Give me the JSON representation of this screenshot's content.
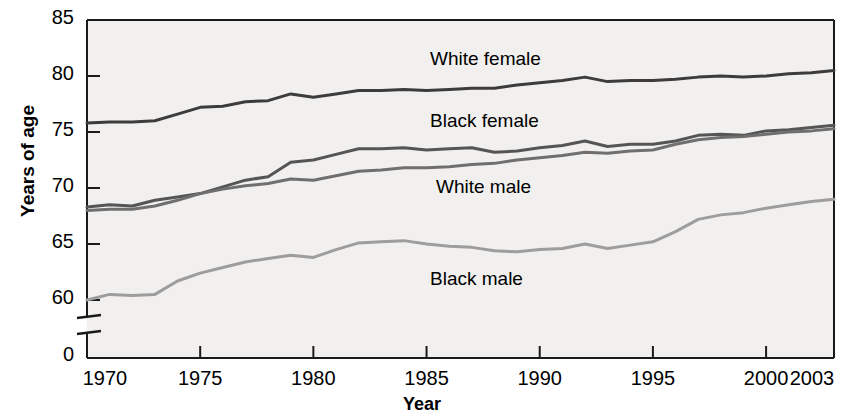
{
  "chart_data": {
    "type": "line",
    "title": "",
    "xlabel": "Year",
    "ylabel": "Years of age",
    "xlim": [
      1970,
      2003
    ],
    "ylim": [
      58.5,
      85
    ],
    "y_axis_break": true,
    "y_zero_tick": "0",
    "grid": false,
    "legend_position": "inline-labels",
    "yticks": [
      60,
      65,
      70,
      75,
      80,
      85
    ],
    "ytick_labels": [
      "60",
      "65",
      "70",
      "75",
      "80",
      "85"
    ],
    "xticks": [
      1970,
      1975,
      1980,
      1985,
      1990,
      1995,
      2000,
      2003
    ],
    "xtick_labels": [
      "1970",
      "1975",
      "1980",
      "1985",
      "1990",
      "1995",
      "2000",
      "2003"
    ],
    "x": [
      1970,
      1971,
      1972,
      1973,
      1974,
      1975,
      1976,
      1977,
      1978,
      1979,
      1980,
      1981,
      1982,
      1983,
      1984,
      1985,
      1986,
      1987,
      1988,
      1989,
      1990,
      1991,
      1992,
      1993,
      1994,
      1995,
      1996,
      1997,
      1998,
      1999,
      2000,
      2001,
      2002,
      2003
    ],
    "series": [
      {
        "name": "White female",
        "color": "#3c3c3c",
        "label_x": 430,
        "label_y": 48,
        "values": [
          75.8,
          75.9,
          75.9,
          76.0,
          76.6,
          77.2,
          77.3,
          77.7,
          77.8,
          78.4,
          78.1,
          78.4,
          78.7,
          78.7,
          78.8,
          78.7,
          78.8,
          78.9,
          78.9,
          79.2,
          79.4,
          79.6,
          79.9,
          79.5,
          79.6,
          79.6,
          79.7,
          79.9,
          80.0,
          79.9,
          80.0,
          80.2,
          80.3,
          80.5
        ]
      },
      {
        "name": "Black female",
        "color": "#555555",
        "label_x": 430,
        "label_y": 110,
        "values": [
          68.3,
          68.5,
          68.4,
          68.9,
          69.2,
          69.5,
          70.1,
          70.7,
          71.0,
          72.3,
          72.5,
          73.0,
          73.5,
          73.5,
          73.6,
          73.4,
          73.5,
          73.6,
          73.2,
          73.3,
          73.6,
          73.8,
          74.2,
          73.7,
          73.9,
          73.9,
          74.2,
          74.7,
          74.8,
          74.7,
          75.1,
          75.2,
          75.4,
          75.6
        ]
      },
      {
        "name": "White male",
        "color": "#6f6f6f",
        "label_x": 436,
        "label_y": 176,
        "values": [
          68.0,
          68.1,
          68.1,
          68.4,
          68.9,
          69.5,
          69.9,
          70.2,
          70.4,
          70.8,
          70.7,
          71.1,
          71.5,
          71.6,
          71.8,
          71.8,
          71.9,
          72.1,
          72.2,
          72.5,
          72.7,
          72.9,
          73.2,
          73.1,
          73.3,
          73.4,
          73.9,
          74.3,
          74.5,
          74.6,
          74.8,
          75.0,
          75.1,
          75.3
        ]
      },
      {
        "name": "Black male",
        "color": "#9d9d9d",
        "label_x": 430,
        "label_y": 268,
        "values": [
          60.0,
          60.5,
          60.4,
          60.5,
          61.7,
          62.4,
          62.9,
          63.4,
          63.7,
          64.0,
          63.8,
          64.5,
          65.1,
          65.2,
          65.3,
          65.0,
          64.8,
          64.7,
          64.4,
          64.3,
          64.5,
          64.6,
          65.0,
          64.6,
          64.9,
          65.2,
          66.1,
          67.2,
          67.6,
          67.8,
          68.2,
          68.5,
          68.8,
          69.0
        ]
      }
    ],
    "geometry": {
      "plot_left": 87,
      "plot_right": 834,
      "plot_top": 20,
      "plot_bottom": 358,
      "y_top_value": 85,
      "y_top_px": 20,
      "px_per_unit": 11.2,
      "break_upper_px": 318,
      "break_lower_px": 334,
      "plot_bg": "#f1f0ee",
      "frame_color": "#1a1a1a"
    }
  }
}
